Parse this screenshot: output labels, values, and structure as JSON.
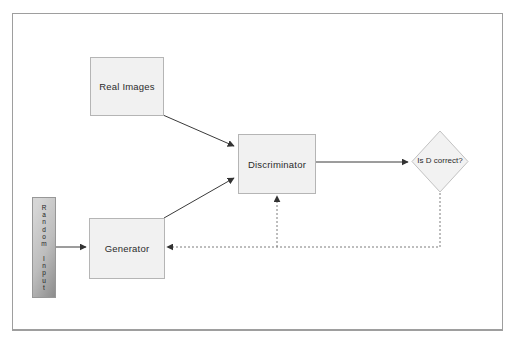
{
  "diagram": {
    "nodes": {
      "real_images": {
        "label": "Real Images"
      },
      "discriminator": {
        "label": "Discriminator"
      },
      "generator": {
        "label": "Generator"
      },
      "decision": {
        "label": "Is D correct?"
      },
      "random_input": {
        "label": "Random Input"
      }
    },
    "edges": [
      {
        "from": "real_images",
        "to": "discriminator",
        "style": "solid"
      },
      {
        "from": "generator",
        "to": "discriminator",
        "style": "solid"
      },
      {
        "from": "random_input",
        "to": "generator",
        "style": "solid"
      },
      {
        "from": "discriminator",
        "to": "decision",
        "style": "solid"
      },
      {
        "from": "decision",
        "to": "generator",
        "style": "dotted"
      },
      {
        "from": "decision",
        "to": "discriminator",
        "style": "dotted"
      }
    ],
    "colors": {
      "node_fill": "#f1f1f1",
      "node_border": "#b5b5b5",
      "frame_border": "#9e9e9e",
      "line_color": "#3a3a3a",
      "dotted_color": "#7d7d7d",
      "text_color": "#2b2b2b",
      "bar_light": "#d6d6d6",
      "bar_dark": "#8c8c8c"
    }
  }
}
